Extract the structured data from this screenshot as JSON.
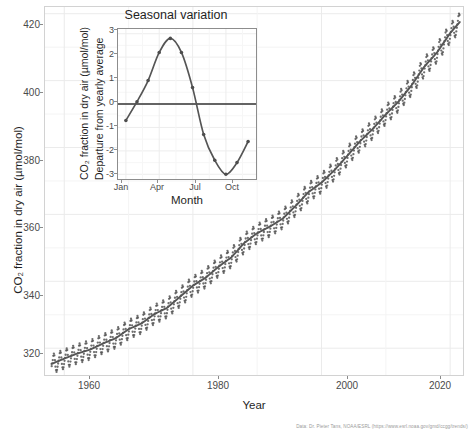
{
  "figure": {
    "caption": "Data: Dr. Pieter Tans, NOAA/ESRL (https://www.esrl.noaa.gov/gmd/ccgg/trends/)"
  },
  "main": {
    "ylabel": "CO₂ fraction in dry air (µmol/mol)",
    "xlabel": "Year",
    "ytick_labels": [
      "320",
      "340",
      "360",
      "380",
      "400",
      "420"
    ],
    "xtick_labels": [
      "1960",
      "1980",
      "2000",
      "2020"
    ]
  },
  "inset": {
    "title": "Seasonal variation",
    "ylabel_line1": "CO₂ fraction in dry air (µmol/mol)",
    "ylabel_line2": "Departure from yearly average",
    "xlabel": "Month",
    "ytick_labels": [
      "-3",
      "-2",
      "-1",
      "0",
      "1",
      "2",
      "3"
    ],
    "xtick_labels": [
      "Jan",
      "Apr",
      "Jul",
      "Oct"
    ]
  },
  "colors": {
    "point": "#4d4d4d",
    "trend_line": "#555555",
    "grid": "#ebebeb",
    "panel_border": "#d2d2d2",
    "inset_border": "#8d8d8d",
    "zero_line": "#333333",
    "background": "#ffffff"
  },
  "chart_data": {
    "type": "line",
    "title": "",
    "xlabel": "Year",
    "ylabel": "CO₂ fraction in dry air (µmol/mol)",
    "xlim": [
      1957,
      2022
    ],
    "ylim": [
      312,
      422
    ],
    "grid": true,
    "legend": "none",
    "series": [
      {
        "name": "Annual trend (smooth)",
        "type": "line",
        "x": [
          1958,
          1960,
          1962,
          1964,
          1966,
          1968,
          1970,
          1972,
          1974,
          1976,
          1978,
          1980,
          1982,
          1984,
          1986,
          1988,
          1990,
          1992,
          1994,
          1996,
          1998,
          2000,
          2002,
          2004,
          2006,
          2008,
          2010,
          2012,
          2014,
          2016,
          2018,
          2020,
          2021.5
        ],
        "values": [
          315.3,
          316.9,
          318.4,
          319.6,
          321.4,
          323.0,
          325.7,
          327.4,
          330.2,
          332.1,
          335.4,
          338.7,
          341.1,
          344.4,
          347.2,
          351.5,
          354.4,
          356.4,
          358.8,
          362.6,
          366.7,
          369.5,
          373.2,
          377.5,
          381.9,
          385.6,
          389.9,
          393.8,
          398.6,
          404.2,
          408.5,
          414.2,
          417.5
        ]
      },
      {
        "name": "Monthly observations",
        "type": "scatter",
        "note": "monthly values = trend + seasonal departure for that month",
        "seasonal_amplitude_ppm": 6.0
      }
    ],
    "inset": {
      "type": "line",
      "title": "Seasonal variation",
      "xlabel": "Month",
      "ylabel": "Departure from yearly average",
      "xlim": [
        1,
        12
      ],
      "ylim": [
        -3.2,
        3.2
      ],
      "grid": true,
      "zero_line": true,
      "categories": [
        "Jan",
        "Feb",
        "Mar",
        "Apr",
        "May",
        "Jun",
        "Jul",
        "Aug",
        "Sep",
        "Oct",
        "Nov",
        "Dec"
      ],
      "values": [
        -0.7,
        0.1,
        1.0,
        2.2,
        2.8,
        2.2,
        0.7,
        -1.3,
        -2.4,
        -3.0,
        -2.5,
        -1.6
      ]
    }
  }
}
